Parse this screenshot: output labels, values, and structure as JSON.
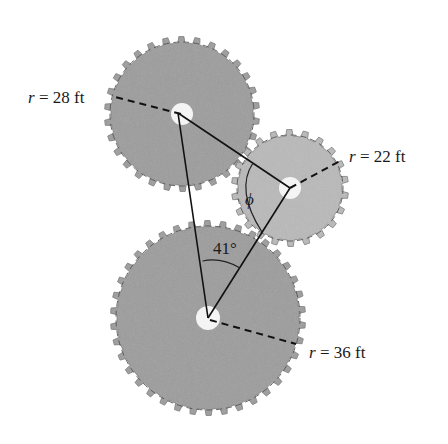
{
  "figure": {
    "colors": {
      "large_gear": "#9c9c9c",
      "small_gear": "#b9b9b9",
      "hub": "#f4f4f4",
      "line": "#111111"
    },
    "gears": [
      {
        "id": "top",
        "radius_label": {
          "var": "r",
          "eq": " = ",
          "value": "28 ft"
        },
        "teeth": 28
      },
      {
        "id": "right",
        "radius_label": {
          "var": "r",
          "eq": " = ",
          "value": "22 ft"
        },
        "teeth": 22
      },
      {
        "id": "bottom",
        "radius_label": {
          "var": "r",
          "eq": " = ",
          "value": "36 ft"
        },
        "teeth": 36
      }
    ],
    "angles": {
      "bottom_angle": "41°",
      "right_angle": "ϕ"
    }
  }
}
